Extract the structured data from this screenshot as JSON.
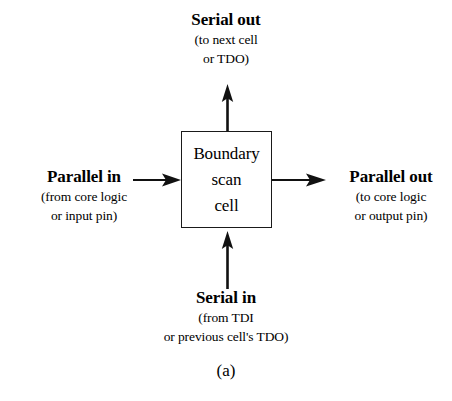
{
  "figure": {
    "caption": "(a)",
    "background_color": "#ffffff",
    "line_color": "#1a1a1a"
  },
  "cell": {
    "lines": [
      "Boundary",
      "scan",
      "cell"
    ]
  },
  "ports": {
    "serial_out": {
      "title": "Serial out",
      "sub_lines": [
        "(to next cell",
        "or TDO)"
      ],
      "direction": "up"
    },
    "parallel_in": {
      "title": "Parallel in",
      "sub_lines": [
        "(from core logic",
        "or input pin)"
      ],
      "direction": "right"
    },
    "parallel_out": {
      "title": "Parallel out",
      "sub_lines": [
        "(to core logic",
        "or output pin)"
      ],
      "direction": "right"
    },
    "serial_in": {
      "title": "Serial in",
      "sub_lines": [
        "(from TDI",
        "or previous cell's TDO)"
      ],
      "direction": "up"
    }
  }
}
